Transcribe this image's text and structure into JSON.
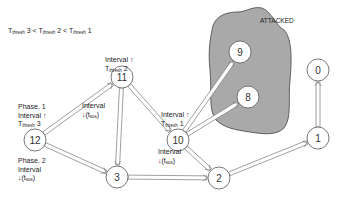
{
  "legend": {
    "parts": [
      {
        "t": "T",
        "sub": "thresh",
        "v": " 3 < "
      },
      {
        "t": "T",
        "sub": "thresh",
        "v": " 2 < "
      },
      {
        "t": "T",
        "sub": "thresh",
        "v": " 1"
      }
    ]
  },
  "attacked_label": "ATTACKED",
  "colors": {
    "attacked_fill": "#a9a9a9",
    "attacked_stroke": "#444444",
    "edge": "#777777",
    "node_stroke": "#555555"
  },
  "nodes": [
    {
      "id": "12",
      "x": 35,
      "y": 140
    },
    {
      "id": "11",
      "x": 122,
      "y": 77
    },
    {
      "id": "10",
      "x": 178,
      "y": 140
    },
    {
      "id": "9",
      "x": 240,
      "y": 52
    },
    {
      "id": "8",
      "x": 248,
      "y": 97
    },
    {
      "id": "3",
      "x": 117,
      "y": 177
    },
    {
      "id": "2",
      "x": 219,
      "y": 178
    },
    {
      "id": "1",
      "x": 318,
      "y": 138
    },
    {
      "id": "0",
      "x": 318,
      "y": 70
    }
  ],
  "edges": [
    {
      "from": "12",
      "to": "11"
    },
    {
      "from": "12",
      "to": "3"
    },
    {
      "from": "11",
      "to": "10"
    },
    {
      "from": "11",
      "to": "3"
    },
    {
      "from": "10",
      "to": "9"
    },
    {
      "from": "10",
      "to": "8"
    },
    {
      "from": "10",
      "to": "2"
    },
    {
      "from": "3",
      "to": "2"
    },
    {
      "from": "2",
      "to": "1"
    },
    {
      "from": "1",
      "to": "0"
    }
  ],
  "annotations": {
    "node12_top": {
      "line1": "Phase. 1",
      "line2": "Interval ↑",
      "line3_t": "T",
      "line3_sub": "thresh",
      "line3_v": " 3"
    },
    "node12_bottom": {
      "line1": "Phase. 2",
      "line2": "Interval",
      "line3": "↓(t",
      "line3_sub": "sos",
      "line3_end": ")"
    },
    "node11_top": {
      "line1": "Interval ↑",
      "line2_t": "T",
      "line2_sub": "thresh",
      "line2_v": " 2"
    },
    "node11_bottom": {
      "line1": "Interval",
      "line2": "↓(t",
      "line2_sub": "sos",
      "line2_end": ")"
    },
    "node10_top": {
      "line1": "Interval ↑",
      "line2_t": "T",
      "line2_sub": "thresh",
      "line2_v": " 1"
    },
    "node10_bottom": {
      "line1": "Interval",
      "line2": "↓(t",
      "line2_sub": "sos",
      "line2_end": ")"
    }
  }
}
